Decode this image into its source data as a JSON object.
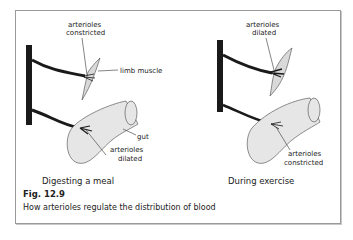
{
  "figure": {
    "number": "Fig. 12.9",
    "caption": "How arterioles regulate the distribution of blood"
  },
  "panels": [
    {
      "subtitle": "Digesting a meal",
      "muscle_label_line1": "arterioles",
      "muscle_label_line2": "constricted",
      "muscle_name": "limb muscle",
      "gut_name": "gut",
      "gut_label_line1": "arterioles",
      "gut_label_line2": "dilated"
    },
    {
      "subtitle": "During exercise",
      "muscle_label_line1": "arterioles",
      "muscle_label_line2": "dilated",
      "gut_label_line1": "arterioles",
      "gut_label_line2": "constricted"
    }
  ],
  "colors": {
    "vessel": "#1a1a1a",
    "tissue_fill": "#d9d9d9",
    "gut_fill": "#e6e6e6",
    "outline": "#444444"
  }
}
